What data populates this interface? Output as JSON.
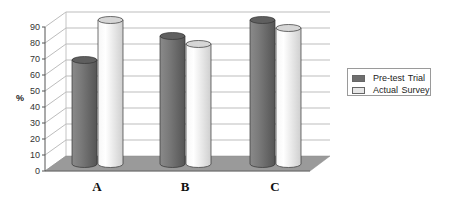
{
  "chart_data": {
    "type": "bar",
    "style": "3d-cylinder",
    "title": "",
    "xlabel": "",
    "ylabel": "%",
    "ylim": [
      0,
      90
    ],
    "yticks": [
      0,
      10,
      20,
      30,
      40,
      50,
      60,
      70,
      80,
      90
    ],
    "grid": true,
    "legend_position": "right",
    "categories": [
      "A",
      "B",
      "C"
    ],
    "series": [
      {
        "name": "Pre-test Trial",
        "values": [
          65,
          80,
          90
        ],
        "color": "#6e6e6e"
      },
      {
        "name": "Actual Survey",
        "values": [
          90,
          75,
          85
        ],
        "color": "#e6e6e6"
      }
    ]
  },
  "legend": {
    "items": [
      {
        "label": "Pre-test Trial",
        "color": "#6e6e6e"
      },
      {
        "label": "Actual Survey",
        "color": "#e6e6e6"
      }
    ]
  },
  "colors": {
    "floor": "#9a9a9a",
    "gridline": "#b8b8b8",
    "axis": "#555555"
  }
}
